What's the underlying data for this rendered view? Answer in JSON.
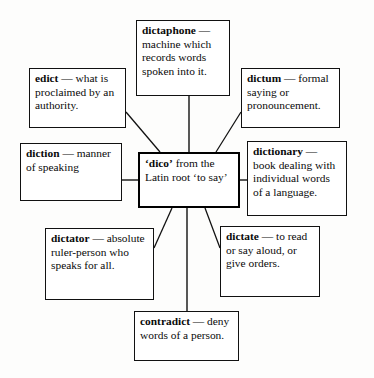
{
  "diagram": {
    "center": {
      "id": "dico",
      "term": "‘dico’",
      "body": " from the Latin root ‘to say’",
      "full_text": "‘dico’ from the Latin root ‘to say’"
    },
    "nodes": [
      {
        "id": "dictaphone",
        "term": "dictaphone",
        "body": " — machine which records words spoken into it.",
        "full_text": "dictaphone — machine which records words spoken into it.",
        "position": "top"
      },
      {
        "id": "edict",
        "term": "edict",
        "body": " — what is proclaimed by an authority.",
        "full_text": "edict — what is proclaimed by an authority.",
        "position": "top-left"
      },
      {
        "id": "dictum",
        "term": "dictum",
        "body": " — formal saying or pronouncement.",
        "full_text": "dictum — formal saying or pronouncement.",
        "position": "top-right"
      },
      {
        "id": "diction",
        "term": "diction",
        "body": " — manner of speaking",
        "full_text": "diction — manner of speaking",
        "position": "left"
      },
      {
        "id": "dictionary",
        "term": "dictionary",
        "body": " — book dealing with individual words of a language.",
        "full_text": "dictionary — book dealing with individual words of a language.",
        "position": "right"
      },
      {
        "id": "dictator",
        "term": "dictator",
        "body": " — absolute ruler-person who speaks for all.",
        "full_text": "dictator — absolute ruler-person who speaks for all.",
        "position": "bottom-left"
      },
      {
        "id": "dictate",
        "term": "dictate",
        "body": " — to read or say aloud, or give orders.",
        "full_text": "dictate — to read or say aloud, or give orders.",
        "position": "bottom-right"
      },
      {
        "id": "contradict",
        "term": "contradict",
        "body": " — deny words of a person.",
        "full_text": "contradict — deny words of a person.",
        "position": "bottom"
      }
    ],
    "colors": {
      "background": "#fdfdfc",
      "line": "#111111",
      "center_border": "#000000",
      "text": "#0a0a0a"
    }
  }
}
